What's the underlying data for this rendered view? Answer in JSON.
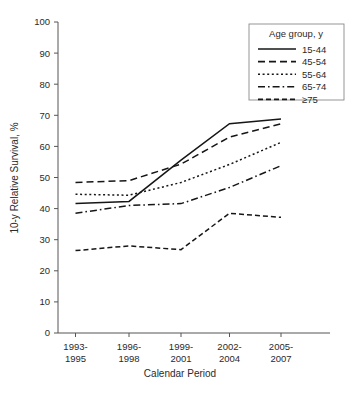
{
  "chart_data": {
    "type": "line",
    "title": "",
    "xlabel": "Calendar Period",
    "ylabel": "10-y Relative Survival, %",
    "categories": [
      "1993-1995",
      "1996-1998",
      "1999-2001",
      "2002-2004",
      "2005-2007"
    ],
    "category_lines": [
      [
        "1993-",
        "1995"
      ],
      [
        "1996-",
        "1998"
      ],
      [
        "1999-",
        "2001"
      ],
      [
        "2002-",
        "2004"
      ],
      [
        "2005-",
        "2007"
      ]
    ],
    "ylim": [
      0,
      100
    ],
    "yticks": [
      0,
      10,
      20,
      30,
      40,
      50,
      60,
      70,
      80,
      90,
      100
    ],
    "ytick_labels": [
      "0",
      "10",
      "20",
      "30",
      "40",
      "50",
      "60",
      "70",
      "80",
      "90",
      "100"
    ],
    "grid": false,
    "legend_position": "top-right",
    "legend_title": "Age group, y",
    "series": [
      {
        "name": "15-44",
        "dash_style": "solid",
        "dasharray": "",
        "values": [
          41.6,
          42.3,
          55.6,
          67.3,
          68.8
        ]
      },
      {
        "name": "45-54",
        "dash_style": "dashed",
        "dasharray": "7,4",
        "values": [
          48.4,
          49.0,
          54.3,
          63.0,
          67.3
        ]
      },
      {
        "name": "55-64",
        "dash_style": "dotted",
        "dasharray": "2,2.6",
        "values": [
          44.6,
          44.3,
          48.4,
          54.2,
          61.3
        ]
      },
      {
        "name": "65-74",
        "dash_style": "dash-dot",
        "dasharray": "7,3,1.6,3",
        "values": [
          38.5,
          41.0,
          41.6,
          46.8,
          53.8
        ]
      },
      {
        "name": "≥75",
        "dash_style": "long-dashed",
        "dasharray": "5,3",
        "values": [
          26.5,
          28.0,
          26.8,
          38.5,
          37.2
        ]
      }
    ]
  },
  "legend": {
    "title": "Age group, y",
    "entries": [
      {
        "label": "15-44"
      },
      {
        "label": "45-54"
      },
      {
        "label": "55-64"
      },
      {
        "label": "65-74"
      },
      {
        "label": "≥75"
      }
    ]
  },
  "axes": {
    "y_title": "10-y Relative Survival, %",
    "x_title": "Calendar Period"
  },
  "colors": {
    "line": "#161616",
    "axis": "#555555",
    "text": "#2a2a2a",
    "background": "#ffffff",
    "legend_border": "#8a8a8a"
  }
}
